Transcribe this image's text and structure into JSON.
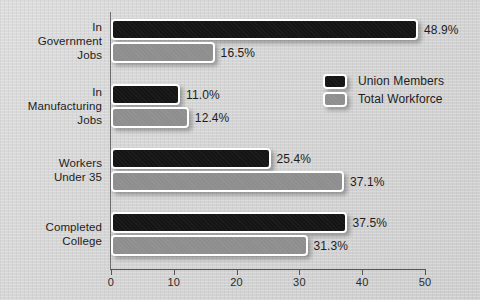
{
  "chart_data": {
    "type": "bar",
    "orientation": "horizontal",
    "title": "",
    "xlabel": "",
    "ylabel": "",
    "xlim": [
      0,
      50
    ],
    "xticks": [
      0,
      10,
      20,
      30,
      40,
      50
    ],
    "xtick_labels": [
      "0",
      "10",
      "20",
      "30",
      "40",
      "50"
    ],
    "grid": false,
    "legend_position": "upper right inside",
    "categories": [
      "In\nGovernment\nJobs",
      "In\nManufacturing\nJobs",
      "Workers\nUnder 35",
      "Completed\nCollege"
    ],
    "series": [
      {
        "name": "Union Members",
        "color": "#151515",
        "values": [
          48.9,
          11.0,
          25.4,
          37.5
        ],
        "value_labels": [
          "48.9%",
          "11.0%",
          "25.4%",
          "37.5%"
        ]
      },
      {
        "name": "Total Workforce",
        "color": "#8e8e8e",
        "values": [
          16.5,
          12.4,
          37.1,
          31.3
        ],
        "value_labels": [
          "16.5%",
          "12.4%",
          "37.1%",
          "31.3%"
        ]
      }
    ]
  },
  "legend": {
    "items": [
      {
        "label": "Union Members",
        "color": "#151515"
      },
      {
        "label": "Total Workforce",
        "color": "#8e8e8e"
      }
    ]
  },
  "axis": {
    "tick_labels": [
      "0",
      "10",
      "20",
      "30",
      "40",
      "50"
    ]
  },
  "colors": {
    "background": "#d6d6d6",
    "union_members": "#151515",
    "total_workforce": "#8e8e8e",
    "axis_line": "#555555",
    "text": "#1d1d1d"
  }
}
